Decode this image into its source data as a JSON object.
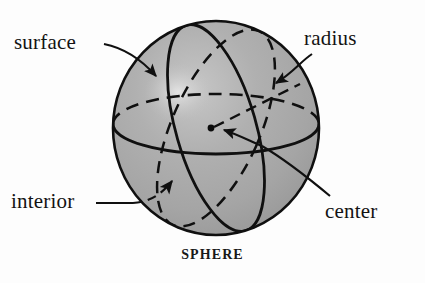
{
  "figure": {
    "caption": "SPHERE",
    "background_color": "#fdfdfd",
    "sphere": {
      "fill_color": "#a8a8a8",
      "outline_color": "#101010",
      "highlight_color": "#d8d8d8",
      "center_x": 216,
      "center_y": 128,
      "radius_x": 104,
      "radius_y": 108
    },
    "labels": {
      "surface": "surface",
      "radius": "radius",
      "interior": "interior",
      "center": "center"
    },
    "parts": [
      {
        "name": "surface",
        "label": "surface",
        "pointer": "curved-arrow",
        "target": "outer-shell-upper-left"
      },
      {
        "name": "radius",
        "label": "radius",
        "pointer": "curved-arrow",
        "target": "dashed-radius-segment"
      },
      {
        "name": "interior",
        "label": "interior",
        "pointer": "dashed-arrow",
        "target": "inside-lower-left"
      },
      {
        "name": "center",
        "label": "center",
        "pointer": "curved-arrow",
        "target": "center-dot"
      }
    ],
    "geometry": {
      "equator": "ellipse, front half solid, back half dashed",
      "meridian": "solid tilted great circle",
      "secondary_circle": "dashed tilted great circle",
      "center_dot": {
        "x": 211,
        "y": 128,
        "r": 3.2
      }
    }
  }
}
